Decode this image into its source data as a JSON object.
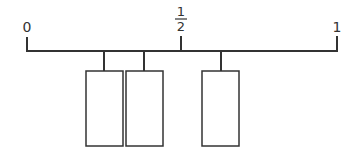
{
  "diagram": {
    "type": "number-line-with-boxes",
    "stroke_color": "#333333",
    "labels": {
      "zero": "0",
      "half_numerator": "1",
      "half_denominator": "2",
      "one": "1"
    },
    "line": {
      "x_start": 27,
      "x_end": 337,
      "y": 51
    },
    "ticks": [
      {
        "name": "tick-0",
        "x": 27
      },
      {
        "name": "tick-half",
        "x": 181
      },
      {
        "name": "tick-1",
        "x": 337
      }
    ],
    "boxes": [
      {
        "name": "box-1",
        "x": 86,
        "width": 37,
        "connector_x": 104
      },
      {
        "name": "box-2",
        "x": 126,
        "width": 37,
        "connector_x": 144
      },
      {
        "name": "box-3",
        "x": 202,
        "width": 37,
        "connector_x": 221
      }
    ]
  }
}
